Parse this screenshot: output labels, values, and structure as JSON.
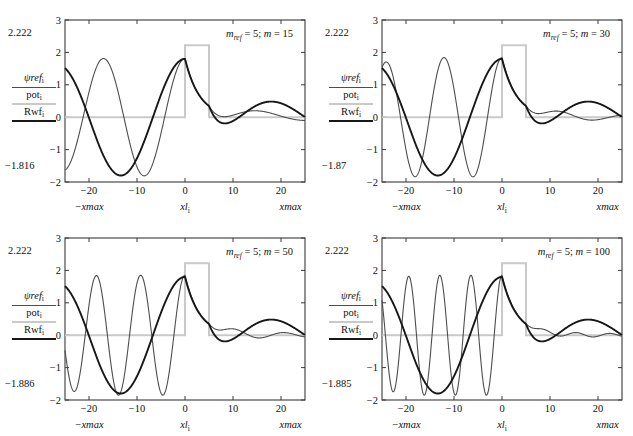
{
  "figure": {
    "type": "multi-panel-line-chart",
    "panel_count": 4,
    "colors": {
      "psiref": "#4d4d4d",
      "pot": "#c9c9c9",
      "rwf": "#171717",
      "axis": "#3a3a3a",
      "background": "#ffffff"
    }
  },
  "legend": {
    "entries": [
      {
        "key": "psiref",
        "label_main": "ψref",
        "label_sub": "i",
        "color": "#4d4d4d",
        "width": 1.1
      },
      {
        "key": "pot",
        "label_main": "pot",
        "label_sub": "i",
        "color": "#c9c9c9",
        "width": 2.0
      },
      {
        "key": "rwf",
        "label_main": "Rwf",
        "label_sub": "i",
        "color": "#171717",
        "width": 2.0
      }
    ]
  },
  "axes": {
    "x": {
      "ticks": [
        -20,
        -10,
        0,
        10,
        20
      ],
      "tick_labels": [
        "−20",
        "−10",
        "0",
        "10",
        "20"
      ],
      "range": [
        -25,
        25
      ],
      "name_left": "−xmax",
      "name_center_main": "xl",
      "name_center_sub": "i",
      "name_right": "xmax"
    },
    "y": {
      "ticks": [
        3,
        2,
        1,
        0,
        -1,
        -2
      ],
      "tick_labels": [
        "3",
        "2",
        "1",
        "0",
        "−1",
        "−2"
      ],
      "range": [
        -2,
        3
      ]
    }
  },
  "chart_data": {
    "type": "line",
    "title": "",
    "xlabel": "xl_i",
    "ylabel": "ψref_i / pot_i / Rwf_i",
    "xlim": [
      -25,
      25
    ],
    "ylim": [
      -2,
      3
    ],
    "grid": false,
    "legend_position": "left-outside",
    "shared": {
      "m_ref": 5,
      "barrier": {
        "x_start": 0,
        "x_end": 5,
        "height": 2.222,
        "baseline": 0.0
      },
      "rwf_note": "reference wavefunction: same in all panels; k=0.235 left of barrier, decaying oscillation right of barrier",
      "psiref_note": "wavefunction for given m: oscillation wavenumber grows with m left of barrier; transmitted decaying tail right of barrier"
    },
    "panels": [
      {
        "id": "panel-1",
        "title_main": "m",
        "title_sub": "ref",
        "title_rest": " = 5; ",
        "title_m_var": "m",
        "title_m_value": " = 15",
        "title_text": "m_ref = 5; m = 15",
        "m_ref": 5,
        "m": 15,
        "y_max_annotation": "2.222",
        "y_min_annotation": "−1.816",
        "y_max_value": 2.222,
        "y_min_value": -1.816,
        "series": [
          {
            "name": "ψref_i",
            "key": "psiref",
            "color": "#4d4d4d",
            "k_left": 0.37,
            "amp_left": 1.81,
            "phase": 0.0,
            "right_amp": 0.32,
            "right_k": 0.3,
            "right_decay": 0.055
          },
          {
            "name": "pot_i",
            "key": "pot",
            "color": "#c9c9c9"
          },
          {
            "name": "Rwf_i",
            "key": "rwf",
            "color": "#171717",
            "k_left": 0.235,
            "amp_left": 1.8,
            "phase": 0.0,
            "right_amp": 0.62,
            "right_k": 0.235,
            "right_decay": 0.02
          }
        ]
      },
      {
        "id": "panel-2",
        "title_main": "m",
        "title_sub": "ref",
        "title_rest": " = 5; ",
        "title_m_var": "m",
        "title_m_value": " = 30",
        "title_text": "m_ref = 5; m = 30",
        "m_ref": 5,
        "m": 30,
        "y_max_annotation": "2.222",
        "y_min_annotation": "−1.87",
        "y_max_value": 2.222,
        "y_min_value": -1.87,
        "series": [
          {
            "name": "ψref_i",
            "key": "psiref",
            "color": "#4d4d4d",
            "k_left": 0.52,
            "amp_left": 1.84,
            "phase": 0.0,
            "right_amp": 0.22,
            "right_k": 0.45,
            "right_decay": 0.06
          },
          {
            "name": "pot_i",
            "key": "pot",
            "color": "#c9c9c9"
          },
          {
            "name": "Rwf_i",
            "key": "rwf",
            "color": "#171717",
            "k_left": 0.235,
            "amp_left": 1.8,
            "phase": 0.0,
            "right_amp": 0.62,
            "right_k": 0.235,
            "right_decay": 0.02
          }
        ]
      },
      {
        "id": "panel-3",
        "title_main": "m",
        "title_sub": "ref",
        "title_rest": " = 5; ",
        "title_m_var": "m",
        "title_m_value": " = 50",
        "title_text": "m_ref = 5; m = 50",
        "m_ref": 5,
        "m": 50,
        "y_max_annotation": "2.222",
        "y_min_annotation": "−1.886",
        "y_max_value": 2.222,
        "y_min_value": -1.886,
        "series": [
          {
            "name": "ψref_i",
            "key": "psiref",
            "color": "#4d4d4d",
            "k_left": 0.68,
            "amp_left": 1.85,
            "phase": 0.0,
            "right_amp": 0.17,
            "right_k": 0.6,
            "right_decay": 0.05
          },
          {
            "name": "pot_i",
            "key": "pot",
            "color": "#c9c9c9"
          },
          {
            "name": "Rwf_i",
            "key": "rwf",
            "color": "#171717",
            "k_left": 0.235,
            "amp_left": 1.8,
            "phase": 0.0,
            "right_amp": 0.62,
            "right_k": 0.235,
            "right_decay": 0.02
          }
        ]
      },
      {
        "id": "panel-4",
        "title_main": "m",
        "title_sub": "ref",
        "title_rest": " = 5; ",
        "title_m_var": "m",
        "title_m_value": " = 100",
        "title_text": "m_ref = 5; m = 100",
        "m_ref": 5,
        "m": 100,
        "y_max_annotation": "2.222",
        "y_min_annotation": "−1.885",
        "y_max_value": 2.222,
        "y_min_value": -1.885,
        "series": [
          {
            "name": "ψref_i",
            "key": "psiref",
            "color": "#4d4d4d",
            "k_left": 0.97,
            "amp_left": 1.85,
            "phase": 0.0,
            "right_amp": 0.09,
            "right_k": 0.9,
            "right_decay": 0.03
          },
          {
            "name": "pot_i",
            "key": "pot",
            "color": "#c9c9c9"
          },
          {
            "name": "Rwf_i",
            "key": "rwf",
            "color": "#171717",
            "k_left": 0.235,
            "amp_left": 1.8,
            "phase": 0.0,
            "right_amp": 0.62,
            "right_k": 0.235,
            "right_decay": 0.02
          }
        ]
      }
    ]
  }
}
